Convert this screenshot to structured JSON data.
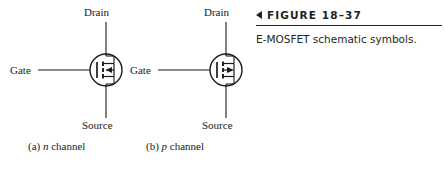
{
  "figure": {
    "marker_icon": "left-triangle-icon",
    "number": "FIGURE 18–37",
    "caption": "E-MOSFET schematic symbols.",
    "rule_color": "#231f20"
  },
  "symbols": [
    {
      "id": "n-channel",
      "sub_caption_prefix": "(a) ",
      "sub_caption_italic": "n",
      "sub_caption_suffix": " channel",
      "terminals": {
        "drain": "Drain",
        "gate": "Gate",
        "source": "Source"
      },
      "arrow_direction": "left",
      "line_color": "#1a1a1a"
    },
    {
      "id": "p-channel",
      "sub_caption_prefix": "(b) ",
      "sub_caption_italic": "p",
      "sub_caption_suffix": " channel",
      "terminals": {
        "drain": "Drain",
        "gate": "Gate",
        "source": "Source"
      },
      "arrow_direction": "right",
      "line_color": "#1a1a1a"
    }
  ]
}
